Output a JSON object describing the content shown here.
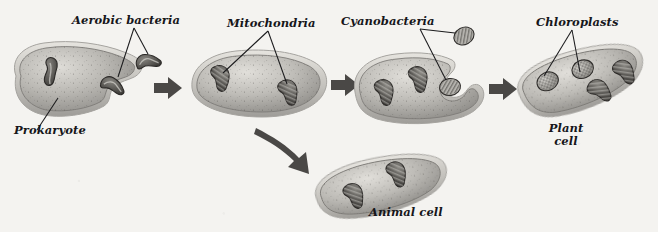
{
  "figure": {
    "background_color": "#f4f3f0",
    "style": "grayscale textbook illustration"
  },
  "labels": {
    "aerobic_bacteria": "Aerobic bacteria",
    "mitochondria": "Mitochondria",
    "cyanobacteria": "Cyanobacteria",
    "chloroplasts": "Chloroplasts",
    "prokaryote": "Prokaryote",
    "plant_cell_line1": "Plant",
    "plant_cell_line2": "cell",
    "animal_cell": "Animal cell"
  },
  "colors": {
    "cell_fill_light": "#d9d7d2",
    "cell_fill_mid": "#a9a7a2",
    "cell_fill_dark": "#7d7b77",
    "membrane_outer": "#bdbbb6",
    "membrane_edge": "#8b8985",
    "organelle_dark": "#4c4a47",
    "organelle_fill": "#6e6c68",
    "arrow_fill": "#4a4846",
    "leader_line": "#1b1b1d",
    "text": "#16161a"
  },
  "stages": [
    {
      "id": "stage-1",
      "name": "prokaryote-engulfing-aerobic-bacteria",
      "label": "Prokaryote",
      "organelles": [
        "aerobic-bacterium-engulfed",
        "aerobic-bacterium-free"
      ],
      "description": "Ancestral prokaryote with a concave notch engulfing an aerobic bacterium"
    },
    {
      "id": "stage-2",
      "name": "cell-with-mitochondria",
      "label": "Mitochondria",
      "organelles": [
        "mitochondrion",
        "mitochondrion"
      ],
      "description": "Oval cell containing two mitochondria"
    },
    {
      "id": "stage-3",
      "name": "cell-engulfing-cyanobacteria",
      "label": "Cyanobacteria",
      "organelles": [
        "mitochondrion",
        "mitochondrion",
        "cyanobacterium-engulfed",
        "cyanobacterium-free"
      ],
      "description": "Cell with two mitochondria engulfing a cyanobacterium"
    },
    {
      "id": "stage-4",
      "name": "plant-cell",
      "label": "Plant cell",
      "organelles": [
        "chloroplast",
        "chloroplast",
        "mitochondrion",
        "mitochondrion"
      ],
      "description": "Tilted plant cell with two chloroplasts and two mitochondria"
    },
    {
      "id": "stage-5",
      "name": "animal-cell",
      "label": "Animal cell",
      "organelles": [
        "mitochondrion",
        "mitochondrion"
      ],
      "description": "Tilted animal cell with two mitochondria"
    }
  ],
  "arrows": [
    {
      "id": "arrow-1",
      "name": "arrow-prokaryote-to-mitochondria",
      "direction": "right"
    },
    {
      "id": "arrow-2",
      "name": "arrow-mitochondria-to-cyanobacteria",
      "direction": "right"
    },
    {
      "id": "arrow-3",
      "name": "arrow-cyanobacteria-to-plant-cell",
      "direction": "right"
    },
    {
      "id": "arrow-4",
      "name": "arrow-branch-to-animal-cell",
      "direction": "down-right-curved"
    }
  ],
  "leader_lines": [
    {
      "from": "aerobic_bacteria",
      "to": [
        "aerobic-bacterium-free",
        "aerobic-bacterium-engulfed"
      ]
    },
    {
      "from": "mitochondria",
      "to": [
        "mitochondrion-left",
        "mitochondrion-right"
      ]
    },
    {
      "from": "cyanobacteria",
      "to": [
        "cyanobacterium-free",
        "cyanobacterium-engulfed"
      ]
    },
    {
      "from": "chloroplasts",
      "to": [
        "chloroplast-left",
        "chloroplast-right"
      ]
    },
    {
      "from": "prokaryote",
      "to": [
        "stage-1-cytoplasm"
      ]
    }
  ]
}
